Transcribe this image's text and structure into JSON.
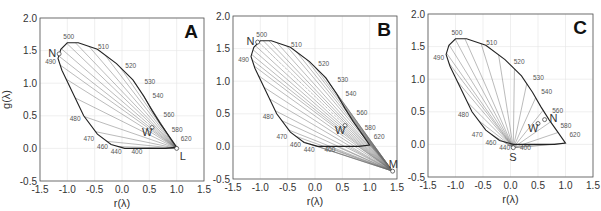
{
  "chart_data": [
    {
      "type": "line",
      "panel": "A",
      "title": "A",
      "xlabel": "r(λ)",
      "ylabel": "g(λ)",
      "xlim": [
        -1.5,
        1.5
      ],
      "ylim": [
        -0.5,
        2.0
      ],
      "xticks": [
        "-1.5",
        "-1.0",
        "-0.5",
        "0.0",
        "0.5",
        "1.0",
        "1.5"
      ],
      "yticks": [
        "-0.5",
        "0.0",
        "0.5",
        "1.0",
        "1.5",
        "2.0"
      ],
      "grid": true,
      "spectral_locus": {
        "wavelengths": [
          400,
          440,
          460,
          470,
          480,
          490,
          500,
          510,
          520,
          530,
          540,
          560,
          580,
          620
        ],
        "r": [
          0.1,
          0.05,
          -0.2,
          -0.45,
          -0.7,
          -1.15,
          -1.0,
          -0.55,
          -0.05,
          0.3,
          0.45,
          0.65,
          0.8,
          1.0
        ],
        "g": [
          0.0,
          0.0,
          0.05,
          0.15,
          0.45,
          1.35,
          1.62,
          1.5,
          1.2,
          0.95,
          0.75,
          0.45,
          0.25,
          0.05
        ]
      },
      "points": [
        {
          "label": "N",
          "r": -1.15,
          "g": 1.45
        },
        {
          "label": "W",
          "r": 0.55,
          "g": 0.32
        },
        {
          "label": "L",
          "r": 1.0,
          "g": 0.0
        }
      ],
      "convergence_point": "L",
      "annotations": [
        "Lines converge on L at (1.0, 0.0)",
        "Dashed line from N toward W"
      ]
    },
    {
      "type": "line",
      "panel": "B",
      "title": "B",
      "xlabel": "r(λ)",
      "ylabel": "",
      "xlim": [
        -1.5,
        1.5
      ],
      "ylim": [
        -0.5,
        2.0
      ],
      "xticks": [
        "-1.5",
        "-1.0",
        "-0.5",
        "0.0",
        "0.5",
        "1.0",
        "1.5"
      ],
      "yticks": [
        "-0.5",
        "0.0",
        "0.5",
        "1.0",
        "1.5",
        "2.0"
      ],
      "grid": true,
      "spectral_locus": {
        "wavelengths": [
          400,
          440,
          460,
          470,
          480,
          490,
          500,
          510,
          520,
          530,
          540,
          560,
          580,
          620
        ],
        "r": [
          0.1,
          0.05,
          -0.2,
          -0.45,
          -0.7,
          -1.15,
          -1.0,
          -0.55,
          -0.05,
          0.3,
          0.45,
          0.65,
          0.8,
          1.0
        ],
        "g": [
          0.0,
          0.0,
          0.05,
          0.15,
          0.45,
          1.35,
          1.62,
          1.5,
          1.2,
          0.95,
          0.75,
          0.45,
          0.25,
          0.05
        ]
      },
      "points": [
        {
          "label": "N",
          "r": -1.05,
          "g": 1.6
        },
        {
          "label": "W",
          "r": 0.55,
          "g": 0.32
        },
        {
          "label": "M",
          "r": 1.42,
          "g": -0.38
        }
      ],
      "convergence_point": "M",
      "annotations": [
        "Lines converge on M at (1.42, -0.38)",
        "Dashed line from N toward W"
      ]
    },
    {
      "type": "line",
      "panel": "C",
      "title": "C",
      "xlabel": "r(λ)",
      "ylabel": "",
      "xlim": [
        -1.5,
        1.5
      ],
      "ylim": [
        -0.5,
        2.0
      ],
      "xticks": [
        "-1.5",
        "-1.0",
        "-0.5",
        "0.0",
        "0.5",
        "1.0",
        "1.5"
      ],
      "yticks": [
        "-0.5",
        "0.0",
        "0.5",
        "1.0",
        "1.5",
        "2.0"
      ],
      "grid": true,
      "spectral_locus": {
        "wavelengths": [
          400,
          440,
          460,
          470,
          480,
          490,
          500,
          510,
          520,
          530,
          540,
          560,
          580,
          620
        ],
        "r": [
          0.1,
          0.05,
          -0.2,
          -0.45,
          -0.7,
          -1.15,
          -1.0,
          -0.55,
          -0.05,
          0.3,
          0.45,
          0.65,
          0.8,
          1.0
        ],
        "g": [
          0.0,
          0.0,
          0.05,
          0.15,
          0.45,
          1.35,
          1.62,
          1.5,
          1.2,
          0.95,
          0.75,
          0.45,
          0.25,
          0.05
        ]
      },
      "points": [
        {
          "label": "W",
          "r": 0.5,
          "g": 0.32
        },
        {
          "label": "N",
          "r": 0.62,
          "g": 0.38
        },
        {
          "label": "S",
          "r": 0.05,
          "g": -0.05
        }
      ],
      "convergence_point": "S",
      "annotations": [
        "Lines converge on S at (0.05, -0.05)"
      ]
    }
  ],
  "panels": [
    {
      "letter": "A",
      "xlabel": "r(λ)",
      "ylabel": "g(λ)",
      "show_ylabel": true
    },
    {
      "letter": "B",
      "xlabel": "r(λ)",
      "ylabel": "",
      "show_ylabel": false
    },
    {
      "letter": "C",
      "xlabel": "r(λ)",
      "ylabel": "",
      "show_ylabel": false
    }
  ]
}
